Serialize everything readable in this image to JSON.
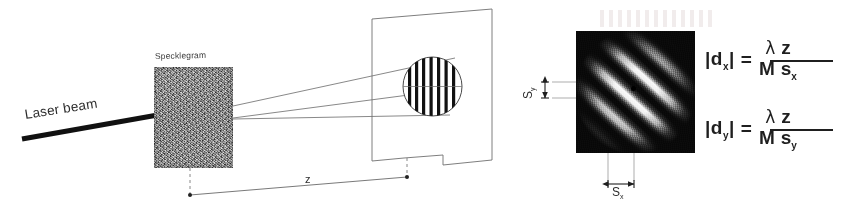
{
  "figure": {
    "caption_present": false,
    "labels": {
      "laser_beam": "Laser beam",
      "specklegram": "Specklegram",
      "distance_z": "z",
      "spacing_y_base": "S",
      "spacing_y_sub": "y",
      "spacing_x_base": "S",
      "spacing_x_sub": "x"
    },
    "equations": [
      {
        "id": "dx",
        "lhs_abs_open": "|",
        "lhs_base": "d",
        "lhs_sub": "x",
        "lhs_abs_close": "|",
        "equals": "=",
        "numerator_lambda": "λ",
        "numerator_z": "z",
        "denominator_m": "M",
        "denominator_s_base": "s",
        "denominator_s_sub": "x"
      },
      {
        "id": "dy",
        "lhs_abs_open": "|",
        "lhs_base": "d",
        "lhs_sub": "y",
        "lhs_abs_close": "|",
        "equals": "=",
        "numerator_lambda": "λ",
        "numerator_z": "z",
        "denominator_m": "M",
        "denominator_s_base": "s",
        "denominator_s_sub": "y"
      }
    ],
    "colors": {
      "ink": "#262626",
      "line": "#555555",
      "speckle_gray": "#8d8d8d",
      "photo_black": "#0a0a0a",
      "fringe_white": "#ffffff"
    },
    "graphics": {
      "fringe_bars_on_screen": 7,
      "diagonal_fringe_angle_deg": 42,
      "screen_shape": "parallelogram",
      "ray_count": 3
    }
  }
}
